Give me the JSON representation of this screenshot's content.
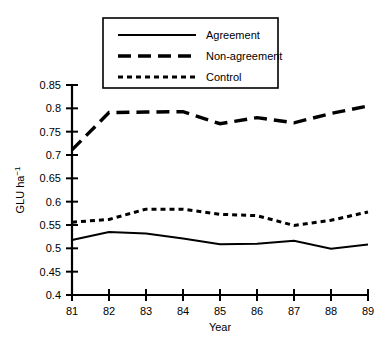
{
  "chart_data": {
    "type": "line",
    "title": "",
    "subtitle": "",
    "xlabel": "Year",
    "ylabel": "GLU ha⁻¹",
    "ylabel_base": "GLU ha",
    "ylabel_exponent": "−1",
    "x": [
      81,
      82,
      83,
      84,
      85,
      86,
      87,
      88,
      89
    ],
    "xtick_labels": [
      "81",
      "82",
      "83",
      "84",
      "85",
      "86",
      "87",
      "88",
      "89"
    ],
    "ytick_labels": [
      "0.4",
      "0.45",
      "0.5",
      "0.55",
      "0.6",
      "0.65",
      "0.7",
      "0.75",
      "0.8",
      "0.85"
    ],
    "ytick_values": [
      0.4,
      0.45,
      0.5,
      0.55,
      0.6,
      0.65,
      0.7,
      0.75,
      0.8,
      0.85
    ],
    "xlim": [
      81,
      89
    ],
    "ylim": [
      0.4,
      0.85
    ],
    "grid": false,
    "legend_position": "top-center",
    "series": [
      {
        "name": "Agreement",
        "style": "solid",
        "color": "#000000",
        "values": [
          0.518,
          0.535,
          0.532,
          0.521,
          0.509,
          0.51,
          0.516,
          0.499,
          0.508
        ]
      },
      {
        "name": "Non-agreement",
        "style": "long-dash",
        "color": "#000000",
        "values": [
          0.711,
          0.791,
          0.792,
          0.793,
          0.767,
          0.78,
          0.769,
          0.789,
          0.805
        ]
      },
      {
        "name": "Control",
        "style": "short-dash",
        "color": "#000000",
        "values": [
          0.556,
          0.562,
          0.584,
          0.584,
          0.573,
          0.57,
          0.549,
          0.56,
          0.578
        ]
      }
    ]
  },
  "legend": {
    "items": [
      {
        "label": "Agreement",
        "style": "solid"
      },
      {
        "label": "Non-agreement",
        "style": "long-dash"
      },
      {
        "label": "Control",
        "style": "short-dash"
      }
    ]
  }
}
